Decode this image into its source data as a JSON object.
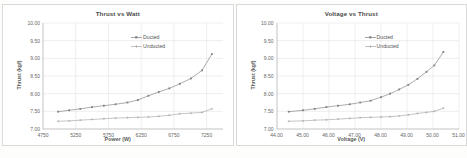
{
  "charts": [
    {
      "id": "thrust-vs-watt",
      "title": "Thrust vs Watt",
      "xlabel": "Power (W)",
      "ylabel": "Thrust (kgf)",
      "xticks": [
        "4750",
        "5250",
        "5750",
        "6250",
        "6750",
        "7250"
      ],
      "yticks": [
        "10.00",
        "9.50",
        "9.00",
        "8.50",
        "8.00",
        "7.50",
        "7.00"
      ],
      "legend": [
        "Ducted",
        "Unducted"
      ]
    },
    {
      "id": "voltage-vs-thrust",
      "title": "Voltage vs Thrust",
      "xlabel": "Voltage (V)",
      "ylabel": "Thrust (kgf)",
      "xticks": [
        "44.00",
        "45.00",
        "46.00",
        "47.00",
        "48.00",
        "49.00",
        "50.00",
        "51.00"
      ],
      "yticks": [
        "10.00",
        "9.50",
        "9.00",
        "8.50",
        "8.00",
        "7.50",
        "7.00"
      ],
      "legend": [
        "Ducted",
        "Unducted"
      ]
    }
  ],
  "chart_data": [
    {
      "type": "line",
      "title": "Thrust vs Watt",
      "xlabel": "Power (W)",
      "ylabel": "Thrust (kgf)",
      "xlim": [
        4750,
        7500
      ],
      "ylim": [
        7.0,
        10.0
      ],
      "xticks": [
        4750,
        5250,
        5750,
        6250,
        6750,
        7250
      ],
      "yticks": [
        7.0,
        7.5,
        8.0,
        8.5,
        9.0,
        9.5,
        10.0
      ],
      "grid": true,
      "legend_position": "inside-top-right",
      "series": [
        {
          "name": "Ducted",
          "marker": "square",
          "color": "#808080",
          "x": [
            4980,
            5150,
            5320,
            5500,
            5680,
            5860,
            6040,
            6200,
            6360,
            6520,
            6680,
            6840,
            7010,
            7180,
            7330
          ],
          "y": [
            7.49,
            7.53,
            7.57,
            7.62,
            7.66,
            7.7,
            7.75,
            7.82,
            7.94,
            8.05,
            8.15,
            8.28,
            8.43,
            8.66,
            9.12
          ]
        },
        {
          "name": "Unducted",
          "marker": "cross",
          "color": "#a6a6a6",
          "x": [
            4980,
            5150,
            5320,
            5500,
            5680,
            5860,
            6040,
            6200,
            6360,
            6520,
            6680,
            6840,
            7010,
            7180,
            7330
          ],
          "y": [
            7.22,
            7.23,
            7.25,
            7.27,
            7.29,
            7.31,
            7.32,
            7.33,
            7.34,
            7.36,
            7.39,
            7.43,
            7.45,
            7.47,
            7.57
          ]
        }
      ]
    },
    {
      "type": "line",
      "title": "Voltage vs Thrust",
      "xlabel": "Voltage (V)",
      "ylabel": "Thrust (kgf)",
      "xlim": [
        44.0,
        51.0
      ],
      "ylim": [
        7.0,
        10.0
      ],
      "xticks": [
        44.0,
        45.0,
        46.0,
        47.0,
        48.0,
        49.0,
        50.0,
        51.0
      ],
      "yticks": [
        7.0,
        7.5,
        8.0,
        8.5,
        9.0,
        9.5,
        10.0
      ],
      "grid": true,
      "legend_position": "inside-top-right",
      "series": [
        {
          "name": "Ducted",
          "marker": "square",
          "color": "#808080",
          "x": [
            44.45,
            45.0,
            45.45,
            45.9,
            46.35,
            46.8,
            47.2,
            47.6,
            48.0,
            48.35,
            48.7,
            49.05,
            49.4,
            49.75,
            50.05,
            50.4
          ],
          "y": [
            7.49,
            7.53,
            7.57,
            7.62,
            7.66,
            7.7,
            7.75,
            7.8,
            7.9,
            8.0,
            8.12,
            8.25,
            8.42,
            8.62,
            8.8,
            9.18
          ]
        },
        {
          "name": "Unducted",
          "marker": "cross",
          "color": "#a6a6a6",
          "x": [
            44.45,
            45.0,
            45.45,
            45.9,
            46.35,
            46.8,
            47.2,
            47.6,
            48.0,
            48.35,
            48.7,
            49.05,
            49.4,
            49.75,
            50.05,
            50.4
          ],
          "y": [
            7.22,
            7.23,
            7.25,
            7.26,
            7.28,
            7.3,
            7.32,
            7.33,
            7.34,
            7.35,
            7.37,
            7.4,
            7.44,
            7.47,
            7.5,
            7.59
          ]
        }
      ]
    }
  ]
}
